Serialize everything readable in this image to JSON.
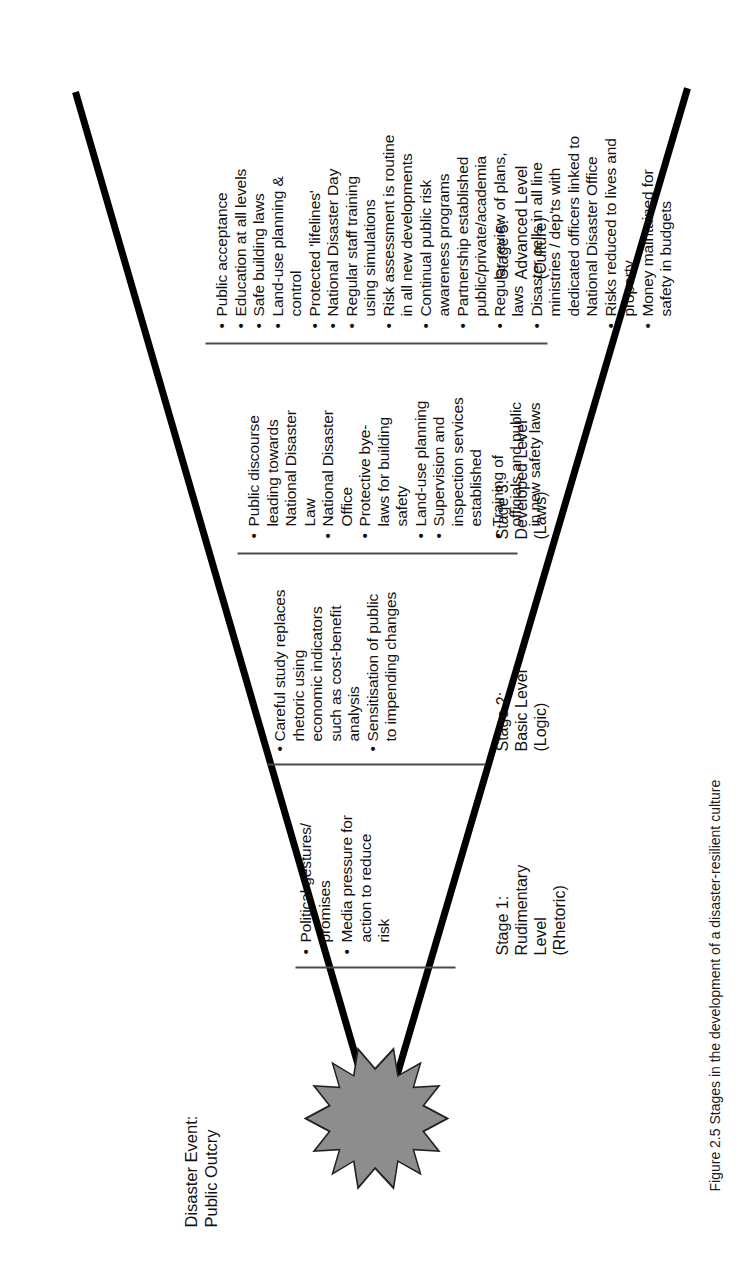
{
  "figure": {
    "caption": "Figure 2.5  Stages in the development of a disaster-resilient culture",
    "event_label": "Disaster Event:\nPublic Outcry",
    "shape_name": "starburst",
    "colors": {
      "line": "#000000",
      "divider": "#4a4a4a",
      "burst_fill": "#8d8d8d",
      "burst_stroke": "#222222"
    }
  },
  "stages": [
    {
      "id": "stage-1",
      "label": "Stage 1:\nRudimentary\nLevel\n(Rhetoric)",
      "bullets": [
        "Political gestures/\npromises",
        "Media pressure for\naction to reduce\nrisk"
      ]
    },
    {
      "id": "stage-2",
      "label": "Stage 2:\nBasic Level\n(Logic)",
      "bullets": [
        "Careful study replaces\nrhetoric using\neconomic indicators\nsuch as cost-benefit\nanalysis",
        "Sensitisation of public\nto impending changes"
      ]
    },
    {
      "id": "stage-3",
      "label": "Stage 3:\nDeveloped Level\n(Laws)",
      "bullets": [
        "Public discourse\nleading towards\nNational Disaster\nLaw",
        "National Disaster\nOffice",
        "Protective bye-\nlaws for building\nsafety",
        "Land-use planning",
        "Supervision and\ninspection services\nestablished",
        "Training of\nofficials and public\nin new safety laws"
      ]
    },
    {
      "id": "stage-5",
      "label": "Stage 5:\nAdvanced Level\n(Culture)",
      "bullets": [
        "Public acceptance",
        "Education at all levels",
        "Safe building laws",
        "Land-use planning &\ncontrol",
        "Protected 'lifelines'",
        "National Disaster Day",
        "Regular staff  training\nusing simulations",
        "Risk assessment is routine\nin all new developments",
        "Continual public risk\nawareness programs",
        "Partnership established\npublic/private/academia",
        "Regular review of plans,\nlaws",
        "Disaster cells in all line\nministries / dep'ts with\ndedicated officers linked to\nNational Disaster Office",
        "Risks reduced to lives and\nproperty",
        "Money maintained for\nsafety in budgets"
      ]
    }
  ],
  "bullet_glyph": "•"
}
